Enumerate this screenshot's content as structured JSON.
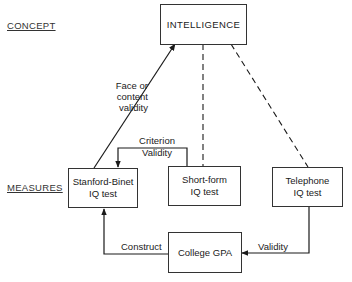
{
  "sections": {
    "concept": "CONCEPT",
    "measures": "MEASURES"
  },
  "nodes": {
    "intelligence": {
      "label": "INTELLIGENCE"
    },
    "stanford_binet": {
      "line1": "Stanford-Binet",
      "line2": "IQ test"
    },
    "short_form": {
      "line1": "Short-form",
      "line2": "IQ test"
    },
    "telephone": {
      "line1": "Telephone",
      "line2": "IQ test"
    },
    "college_gpa": {
      "label": "College GPA"
    }
  },
  "edges": {
    "face_validity": {
      "line1": "Face or",
      "line2": "content",
      "line3": "validity",
      "from": "Stanford-Binet IQ test",
      "to": "INTELLIGENCE",
      "style": "solid"
    },
    "criterion_validity": {
      "line1": "Criterion",
      "line2": "Validity",
      "from": "Short-form IQ test",
      "to": "Stanford-Binet IQ test",
      "style": "solid"
    },
    "construct": {
      "label": "Construct",
      "from": "College GPA",
      "to": "Stanford-Binet IQ test",
      "style": "solid"
    },
    "validity": {
      "label": "Validity",
      "from": "Telephone IQ test",
      "to": "College GPA",
      "style": "solid"
    },
    "short_form_link": {
      "from": "INTELLIGENCE",
      "to": "Short-form IQ test",
      "style": "dashed"
    },
    "telephone_link": {
      "from": "INTELLIGENCE",
      "to": "Telephone IQ test",
      "style": "dashed"
    }
  }
}
